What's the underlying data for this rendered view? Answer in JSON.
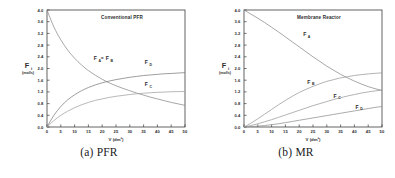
{
  "figure": {
    "panels": [
      {
        "id": "pfr",
        "caption": "(a) PFR",
        "chart_ref": 0
      },
      {
        "id": "mr",
        "caption": "(b) MR",
        "chart_ref": 1
      }
    ]
  },
  "chart_data": [
    {
      "type": "line",
      "title": "Conventional PFR",
      "xlabel": "V (dm³)",
      "ylabel": "F",
      "ylabel_index": "i",
      "ylabel_units": "(mol/s)",
      "xlim": [
        0,
        50
      ],
      "ylim": [
        0.0,
        4.0
      ],
      "xticks": [
        0,
        5,
        10,
        15,
        20,
        25,
        30,
        35,
        40,
        45,
        50
      ],
      "xticklabels": [
        "0",
        "5",
        "10",
        "15",
        "20",
        "25",
        "30",
        "35",
        "40",
        "45",
        "50"
      ],
      "yticks": [
        0.0,
        0.4,
        0.8,
        1.2,
        1.6,
        2.0,
        2.4,
        2.8,
        3.2,
        3.6,
        4.0
      ],
      "yticklabels": [
        "0.0",
        "0.4",
        "0.8",
        "1.2",
        "1.6",
        "2.0",
        "2.4",
        "2.8",
        "3.2",
        "3.6",
        "4.0"
      ],
      "grid": false,
      "legend": "inline-annotations",
      "x": [
        0,
        2.5,
        5,
        7.5,
        10,
        12.5,
        15,
        17.5,
        20,
        22.5,
        25,
        27.5,
        30,
        32.5,
        35,
        37.5,
        40,
        42.5,
        45,
        47.5,
        50
      ],
      "series": [
        {
          "name": "F_A = F_B",
          "label_main": "F",
          "label_sub": "A",
          "label_main2": "F",
          "label_sub2": "B",
          "label_text": "Fₐ = Fʙ",
          "color": "#8a8a8a",
          "label_x": 17.5,
          "label_y": 2.28,
          "values": [
            4.0,
            3.42,
            2.98,
            2.63,
            2.35,
            2.12,
            1.93,
            1.77,
            1.63,
            1.51,
            1.41,
            1.32,
            1.24,
            1.16,
            1.09,
            1.02,
            0.96,
            0.9,
            0.84,
            0.79,
            0.74
          ]
        },
        {
          "name": "F_D",
          "label_main": "F",
          "label_sub": "D",
          "color": "#7d7d7d",
          "label_x": 36.0,
          "label_y": 2.14,
          "values": [
            0.0,
            0.4,
            0.7,
            0.93,
            1.1,
            1.24,
            1.35,
            1.44,
            1.51,
            1.57,
            1.62,
            1.66,
            1.7,
            1.73,
            1.76,
            1.78,
            1.8,
            1.82,
            1.83,
            1.845,
            1.86
          ]
        },
        {
          "name": "F_C",
          "label_main": "F",
          "label_sub": "C",
          "color": "#a0a0a0",
          "label_x": 36.0,
          "label_y": 1.4,
          "values": [
            0.0,
            0.22,
            0.4,
            0.54,
            0.66,
            0.76,
            0.84,
            0.91,
            0.96,
            1.01,
            1.05,
            1.08,
            1.11,
            1.135,
            1.155,
            1.17,
            1.185,
            1.195,
            1.205,
            1.21,
            1.215
          ]
        }
      ]
    },
    {
      "type": "line",
      "title": "Membrane Reactor",
      "xlabel": "V (dm³)",
      "ylabel": "F",
      "ylabel_index": "i",
      "ylabel_units": "(mol/s)",
      "xlim": [
        0,
        50
      ],
      "ylim": [
        0.0,
        4.0
      ],
      "xticks": [
        0,
        5,
        10,
        15,
        20,
        25,
        30,
        35,
        40,
        45,
        50
      ],
      "xticklabels": [
        "0",
        "5",
        "10",
        "15",
        "20",
        "25",
        "30",
        "35",
        "40",
        "45",
        "50"
      ],
      "yticks": [
        0.0,
        0.4,
        0.8,
        1.2,
        1.6,
        2.0,
        2.4,
        2.8,
        3.2,
        3.6,
        4.0
      ],
      "yticklabels": [
        "0.0",
        "0.4",
        "0.8",
        "1.2",
        "1.6",
        "2.0",
        "2.4",
        "2.8",
        "3.2",
        "3.6",
        "4.0"
      ],
      "grid": false,
      "legend": "inline-annotations",
      "x": [
        0,
        2.5,
        5,
        7.5,
        10,
        12.5,
        15,
        17.5,
        20,
        22.5,
        25,
        27.5,
        30,
        32.5,
        35,
        37.5,
        40,
        42.5,
        45,
        47.5,
        50
      ],
      "series": [
        {
          "name": "F_A",
          "label_main": "F",
          "label_sub": "A",
          "color": "#8a8a8a",
          "label_x": 22.0,
          "label_y": 3.1,
          "values": [
            4.0,
            3.86,
            3.72,
            3.57,
            3.41,
            3.25,
            3.08,
            2.91,
            2.74,
            2.57,
            2.4,
            2.24,
            2.08,
            1.94,
            1.8,
            1.68,
            1.57,
            1.47,
            1.38,
            1.31,
            1.25
          ]
        },
        {
          "name": "F_B",
          "label_main": "F",
          "label_sub": "B",
          "color": "#9a9a9a",
          "label_x": 23.5,
          "label_y": 1.48,
          "values": [
            0.0,
            0.13,
            0.28,
            0.44,
            0.6,
            0.76,
            0.91,
            1.05,
            1.18,
            1.29,
            1.39,
            1.48,
            1.56,
            1.62,
            1.68,
            1.72,
            1.76,
            1.79,
            1.815,
            1.835,
            1.85
          ]
        },
        {
          "name": "F_C",
          "label_main": "F",
          "label_sub": "C",
          "color": "#9a9a9a",
          "label_x": 33.0,
          "label_y": 1.0,
          "values": [
            0.0,
            0.05,
            0.11,
            0.18,
            0.25,
            0.33,
            0.41,
            0.49,
            0.57,
            0.65,
            0.73,
            0.8,
            0.87,
            0.94,
            1.0,
            1.06,
            1.11,
            1.16,
            1.2,
            1.235,
            1.26
          ]
        },
        {
          "name": "F_D",
          "label_main": "F",
          "label_sub": "D",
          "color": "#8f8f8f",
          "label_x": 41.0,
          "label_y": 0.62,
          "values": [
            0.0,
            0.01,
            0.03,
            0.05,
            0.08,
            0.11,
            0.15,
            0.19,
            0.23,
            0.27,
            0.31,
            0.35,
            0.39,
            0.43,
            0.47,
            0.51,
            0.55,
            0.59,
            0.63,
            0.67,
            0.7
          ]
        }
      ]
    }
  ]
}
